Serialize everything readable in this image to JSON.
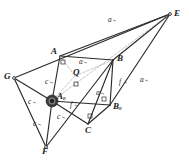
{
  "figure": {
    "background_color": "#ffffff",
    "ink_color": "#2a2a2a",
    "faint_color": "#9a9a9a",
    "vertices": [
      {
        "id": "E",
        "label": "E",
        "sub": "",
        "x": 170,
        "y": 14,
        "lx": 174,
        "ly": 9,
        "dot": true
      },
      {
        "id": "A",
        "label": "A",
        "sub": "",
        "x": 60,
        "y": 56,
        "lx": 51,
        "ly": 47,
        "dot": false
      },
      {
        "id": "B",
        "label": "B",
        "sub": "",
        "x": 113,
        "y": 60,
        "lx": 117,
        "ly": 54,
        "dot": false
      },
      {
        "id": "G",
        "label": "G",
        "sub": "",
        "x": 14,
        "y": 78,
        "lx": 4,
        "ly": 72,
        "dot": true
      },
      {
        "id": "Q",
        "label": "Q",
        "sub": "",
        "x": 75,
        "y": 76,
        "lx": 73,
        "ly": 68,
        "dot": false
      },
      {
        "id": "A0",
        "label": "A",
        "sub": "0",
        "x": 52,
        "y": 101,
        "lx": 57,
        "ly": 92,
        "dot": false
      },
      {
        "id": "B0",
        "label": "B",
        "sub": "0",
        "x": 110,
        "y": 105,
        "lx": 113,
        "ly": 102,
        "dot": false
      },
      {
        "id": "C",
        "label": "C",
        "sub": "",
        "x": 88,
        "y": 124,
        "lx": 85,
        "ly": 126,
        "dot": false
      },
      {
        "id": "F",
        "label": "F",
        "sub": "",
        "x": 46,
        "y": 147,
        "lx": 42,
        "ly": 147,
        "dot": true
      }
    ],
    "edge_labels": [
      {
        "id": "a-top",
        "text": "a",
        "x": 108,
        "y": 16
      },
      {
        "id": "a-AB",
        "text": "a",
        "x": 79,
        "y": 58
      },
      {
        "id": "a-right",
        "text": "a",
        "x": 140,
        "y": 76
      },
      {
        "id": "a-inner",
        "text": "a",
        "x": 96,
        "y": 89
      },
      {
        "id": "c-GA0",
        "text": "c",
        "x": 28,
        "y": 98
      },
      {
        "id": "c-AA0",
        "text": "c",
        "x": 45,
        "y": 78
      },
      {
        "id": "c-A0F",
        "text": "c",
        "x": 33,
        "y": 120
      },
      {
        "id": "c-lower",
        "text": "c",
        "x": 57,
        "y": 113
      },
      {
        "id": "f-B",
        "text": "f",
        "x": 119,
        "y": 78
      },
      {
        "id": "f-A0",
        "text": "f",
        "x": 70,
        "y": 101
      }
    ],
    "segments": [
      {
        "id": "A-E",
        "from": "A",
        "to": "E",
        "style": "solid"
      },
      {
        "id": "B-E",
        "from": "B",
        "to": "E",
        "style": "solid"
      },
      {
        "id": "G-E",
        "from": "G",
        "to": "E",
        "style": "solid"
      },
      {
        "id": "B0-E",
        "from": "B0",
        "to": "E",
        "style": "solid"
      },
      {
        "id": "A0-E",
        "from": "A0",
        "to": "E",
        "style": "faint"
      },
      {
        "id": "A-B",
        "from": "A",
        "to": "B",
        "style": "solid"
      },
      {
        "id": "A-A0",
        "from": "A",
        "to": "A0",
        "style": "solid"
      },
      {
        "id": "A-Q",
        "from": "A",
        "to": "Q",
        "style": "faint"
      },
      {
        "id": "Q-B",
        "from": "Q",
        "to": "B",
        "style": "faint"
      },
      {
        "id": "Q-A0",
        "from": "Q",
        "to": "A0",
        "style": "faint"
      },
      {
        "id": "G-A0",
        "from": "G",
        "to": "A0",
        "style": "solid"
      },
      {
        "id": "G-F",
        "from": "G",
        "to": "F",
        "style": "solid"
      },
      {
        "id": "A0-F",
        "from": "A0",
        "to": "F",
        "style": "solid"
      },
      {
        "id": "A0-B0",
        "from": "A0",
        "to": "B0",
        "style": "solid"
      },
      {
        "id": "A0-C",
        "from": "A0",
        "to": "C",
        "style": "solid"
      },
      {
        "id": "B-B0",
        "from": "B",
        "to": "B0",
        "style": "solid"
      },
      {
        "id": "B-C",
        "from": "B",
        "to": "C",
        "style": "solid"
      },
      {
        "id": "C-B0",
        "from": "C",
        "to": "B0",
        "style": "solid"
      },
      {
        "id": "F-B",
        "from": "F",
        "to": "B",
        "style": "solid"
      }
    ],
    "right_angle_marks": [
      {
        "id": "mark-Q",
        "x": 76,
        "y": 84
      },
      {
        "id": "mark-B0",
        "x": 104,
        "y": 99
      },
      {
        "id": "mark-C",
        "x": 90,
        "y": 116
      },
      {
        "id": "mark-A",
        "x": 63,
        "y": 62
      }
    ],
    "hub": {
      "id": "A0-hub",
      "x": 52,
      "y": 101,
      "radius": 6
    }
  }
}
